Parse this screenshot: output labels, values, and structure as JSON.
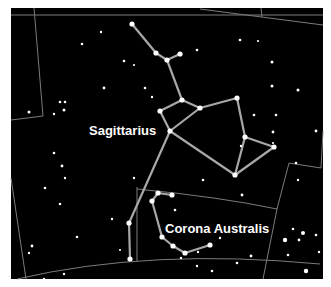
{
  "map": {
    "background": "#000000",
    "border_color": "#ffffff",
    "field": {
      "x": 11,
      "y": 8,
      "width": 312,
      "height": 271
    },
    "constellations": [
      {
        "name": "Sagittarius",
        "label": "Sagittarius",
        "label_pos": [
          89,
          131
        ],
        "stars": [
          [
            132,
            24
          ],
          [
            156,
            53
          ],
          [
            167,
            60
          ],
          [
            180,
            54
          ],
          [
            182,
            100
          ],
          [
            160,
            111
          ],
          [
            200,
            108
          ],
          [
            237,
            98
          ],
          [
            170,
            131
          ],
          [
            245,
            137
          ],
          [
            274,
            147
          ],
          [
            235,
            175
          ],
          [
            129,
            223
          ],
          [
            130,
            259
          ]
        ],
        "lines": [
          [
            0,
            1
          ],
          [
            1,
            2
          ],
          [
            2,
            3
          ],
          [
            2,
            4
          ],
          [
            4,
            5
          ],
          [
            4,
            6
          ],
          [
            6,
            7
          ],
          [
            5,
            8
          ],
          [
            6,
            8
          ],
          [
            7,
            9
          ],
          [
            9,
            10
          ],
          [
            10,
            11
          ],
          [
            9,
            11
          ],
          [
            8,
            11
          ],
          [
            8,
            12
          ],
          [
            12,
            13
          ]
        ]
      },
      {
        "name": "Corona Australis",
        "label": "Corona Australis",
        "label_pos": [
          165,
          229
        ],
        "stars": [
          [
            172,
            195
          ],
          [
            158,
            193
          ],
          [
            152,
            201
          ],
          [
            162,
            237
          ],
          [
            173,
            246
          ],
          [
            185,
            253
          ],
          [
            210,
            245
          ]
        ],
        "lines": [
          [
            0,
            1
          ],
          [
            1,
            2
          ],
          [
            2,
            3
          ],
          [
            3,
            4
          ],
          [
            4,
            5
          ],
          [
            5,
            6
          ]
        ]
      }
    ],
    "line_color": "#a8a8a8",
    "boundary_color": "#8a8a8a"
  }
}
